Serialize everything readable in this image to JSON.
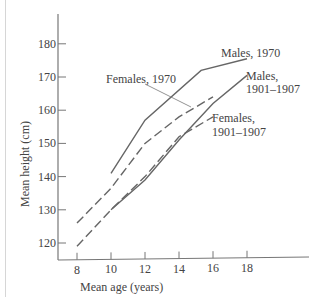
{
  "chart_data": {
    "type": "line",
    "title": "",
    "xlabel": "Mean age (years)",
    "ylabel": "Mean height (cm)",
    "xlim": [
      7,
      22
    ],
    "ylim": [
      115,
      190
    ],
    "x_ticks": [
      8,
      10,
      12,
      14,
      16,
      18
    ],
    "y_ticks": [
      120,
      130,
      140,
      150,
      160,
      170,
      180
    ],
    "grid": false,
    "legend": "inline annotations",
    "series": [
      {
        "name": "Males, 1970",
        "style": "solid",
        "label_lines": [
          "Males, 1970"
        ],
        "x": [
          10,
          12,
          15.3,
          18
        ],
        "y": [
          141,
          157,
          172,
          175.5
        ]
      },
      {
        "name": "Males, 1901–1907",
        "style": "solid",
        "label_lines": [
          "Males,",
          "1901–1907"
        ],
        "x": [
          10,
          12,
          14,
          16,
          18
        ],
        "y": [
          130,
          139,
          151,
          162,
          170.5
        ]
      },
      {
        "name": "Females, 1970",
        "style": "dashed",
        "label_lines": [
          "Females, 1970"
        ],
        "x": [
          8,
          10,
          12,
          14,
          16
        ],
        "y": [
          126,
          136.5,
          150,
          158,
          164
        ]
      },
      {
        "name": "Females, 1901–1907",
        "style": "dashed",
        "label_lines": [
          "Females,",
          "1901–1907"
        ],
        "x": [
          8,
          10,
          12,
          14,
          16
        ],
        "y": [
          119,
          130,
          140,
          152,
          158
        ]
      }
    ]
  },
  "axes": {
    "x_label": "Mean age (years)",
    "y_label": "Mean height (cm)",
    "x_tick_labels": [
      "8",
      "10",
      "12",
      "14",
      "16",
      "18"
    ],
    "y_tick_labels": [
      "180",
      "170",
      "160",
      "150",
      "140",
      "130",
      "120"
    ]
  },
  "annotations": {
    "males_1970": "Males, 1970",
    "males_1901_line1": "Males,",
    "males_1901_line2": "1901–1907",
    "females_1970": "Females, 1970",
    "females_1901_line1": "Females,",
    "females_1901_line2": "1901–1907"
  }
}
